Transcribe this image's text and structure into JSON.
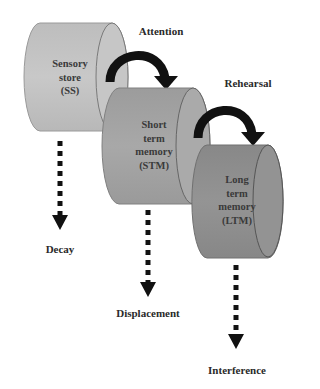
{
  "diagram": {
    "type": "memory-model",
    "colors": {
      "sensory_store": "#c2c2c2",
      "short_term": "#a3a3a3",
      "long_term": "#8f8f8f",
      "arrow": "#111111",
      "text": "#2a2a2a"
    },
    "stores": [
      {
        "id": "ss",
        "lines": [
          "Sensory",
          "store",
          "(SS)"
        ]
      },
      {
        "id": "stm",
        "lines": [
          "Short",
          "term",
          "memory",
          "(STM)"
        ]
      },
      {
        "id": "ltm",
        "lines": [
          "Long",
          "term",
          "memory",
          "(LTM)"
        ]
      }
    ],
    "transfers": [
      {
        "label": "Attention",
        "from": "ss",
        "to": "stm"
      },
      {
        "label": "Rehearsal",
        "from": "stm",
        "to": "ltm"
      }
    ],
    "losses": [
      {
        "label": "Decay",
        "from": "ss"
      },
      {
        "label": "Displacement",
        "from": "stm"
      },
      {
        "label": "Interference",
        "from": "ltm"
      }
    ]
  }
}
